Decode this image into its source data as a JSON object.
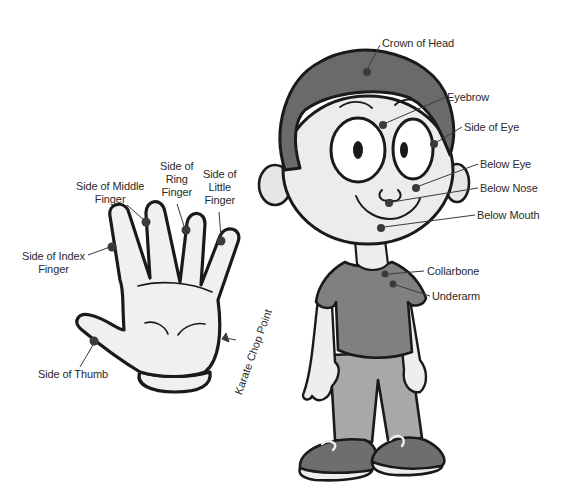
{
  "diagram": {
    "type": "tapping-points-illustration",
    "colors": {
      "outline": "#1a1a1a",
      "skin": "#eeeeee",
      "hair": "#6a6a6a",
      "shirt": "#808080",
      "pants": "#a8a8a8",
      "shoe": "#707070",
      "point": "#3a3a3a",
      "label_text": "#2a2a2a"
    },
    "hand": {
      "labels": [
        {
          "id": "side-of-index-finger",
          "text": "Side of Index\nFinger",
          "x": 22,
          "y": 258
        },
        {
          "id": "side-of-middle-finger",
          "text": "Side of Middle\nFinger",
          "x": 76,
          "y": 180
        },
        {
          "id": "side-of-ring-finger",
          "text": "Side of\nRing\nFinger",
          "x": 160,
          "y": 160
        },
        {
          "id": "side-of-little-finger",
          "text": "Side of\nLittle\nFinger",
          "x": 203,
          "y": 168
        },
        {
          "id": "side-of-thumb",
          "text": "Side of Thumb",
          "x": 38,
          "y": 368
        },
        {
          "id": "karate-chop-point",
          "text": "Karate Chop Point",
          "x": 232,
          "y": 392
        }
      ]
    },
    "boy": {
      "labels": [
        {
          "id": "crown-of-head",
          "text": "Crown of Head",
          "x": 382,
          "y": 37
        },
        {
          "id": "eyebrow",
          "text": "Eyebrow",
          "x": 447,
          "y": 91
        },
        {
          "id": "side-of-eye",
          "text": "Side of Eye",
          "x": 464,
          "y": 121
        },
        {
          "id": "below-eye",
          "text": "Below Eye",
          "x": 480,
          "y": 158
        },
        {
          "id": "below-nose",
          "text": "Below Nose",
          "x": 480,
          "y": 182
        },
        {
          "id": "below-mouth",
          "text": "Below Mouth",
          "x": 477,
          "y": 209
        },
        {
          "id": "collarbone",
          "text": "Collarbone",
          "x": 427,
          "y": 265
        },
        {
          "id": "underarm",
          "text": "Underarm",
          "x": 432,
          "y": 290
        }
      ]
    }
  }
}
